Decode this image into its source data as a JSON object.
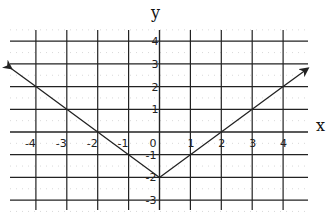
{
  "chart_data": {
    "type": "line",
    "title": "",
    "xlabel": "x",
    "ylabel": "y",
    "xlim": [
      -4.8,
      4.8
    ],
    "ylim": [
      -3.4,
      4.3
    ],
    "grid": true,
    "x_ticks": [
      -4,
      -3,
      -2,
      -1,
      0,
      1,
      2,
      3,
      4
    ],
    "x_tick_labels": [
      "-4",
      "-3",
      "-2",
      "-1",
      "0",
      "1",
      "2",
      "3",
      "4"
    ],
    "y_ticks": [
      -3,
      -2,
      -1,
      1,
      2,
      3,
      4
    ],
    "y_tick_labels": [
      "-3",
      "-2",
      "-1",
      "1",
      "2",
      "3",
      "4"
    ],
    "series": [
      {
        "name": "y = |x| - 2",
        "x": [
          -4.8,
          -4,
          -3,
          -2,
          -1,
          0,
          1,
          2,
          3,
          4,
          4.8
        ],
        "y": [
          2.8,
          2,
          1,
          0,
          -1,
          -2,
          -1,
          0,
          1,
          2,
          2.8
        ],
        "arrows": "both ends",
        "color": "#222222"
      }
    ],
    "vertex": [
      0,
      -2
    ]
  }
}
